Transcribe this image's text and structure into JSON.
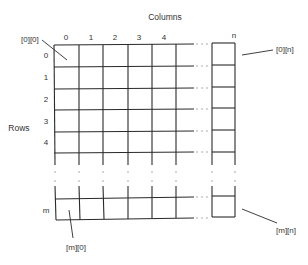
{
  "diagram": {
    "title": "Columns",
    "row_axis_label": "Rows",
    "column_labels": [
      "0",
      "1",
      "2",
      "3",
      "4",
      "n"
    ],
    "row_labels": [
      "0",
      "1",
      "2",
      "3",
      "4",
      "m"
    ],
    "callouts": {
      "top_left": "[0][0]",
      "top_right": "[0][n]",
      "bottom_left": "[m][0]",
      "bottom_right": "[m][n]"
    },
    "ellipsis": ". . .",
    "colors": {
      "line": "#2a2a2a",
      "text": "#333333",
      "background": "#ffffff"
    }
  }
}
